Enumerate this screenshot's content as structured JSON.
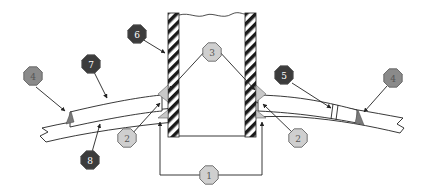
{
  "diagram": {
    "type": "technical cross-section with numbered callouts",
    "colors": {
      "dark_badge": "#3c3c3c",
      "medium_badge": "#8a8a8a",
      "light_badge": "#cfcfcf",
      "dark_text": "#ffffff",
      "light_text": "#555555",
      "weld_fill": "#7a7a7a",
      "fillet_fill": "#c8c8c8",
      "line": "#222222"
    },
    "callouts": [
      {
        "id": "c1",
        "label": "1",
        "tone": "light"
      },
      {
        "id": "c2-left",
        "label": "2",
        "tone": "light"
      },
      {
        "id": "c2-right",
        "label": "2",
        "tone": "light"
      },
      {
        "id": "c3",
        "label": "3",
        "tone": "light"
      },
      {
        "id": "c4-left",
        "label": "4",
        "tone": "medium"
      },
      {
        "id": "c4-right",
        "label": "4",
        "tone": "medium"
      },
      {
        "id": "c5",
        "label": "5",
        "tone": "dark"
      },
      {
        "id": "c6",
        "label": "6",
        "tone": "dark"
      },
      {
        "id": "c7",
        "label": "7",
        "tone": "dark"
      },
      {
        "id": "c8",
        "label": "8",
        "tone": "dark"
      }
    ]
  }
}
